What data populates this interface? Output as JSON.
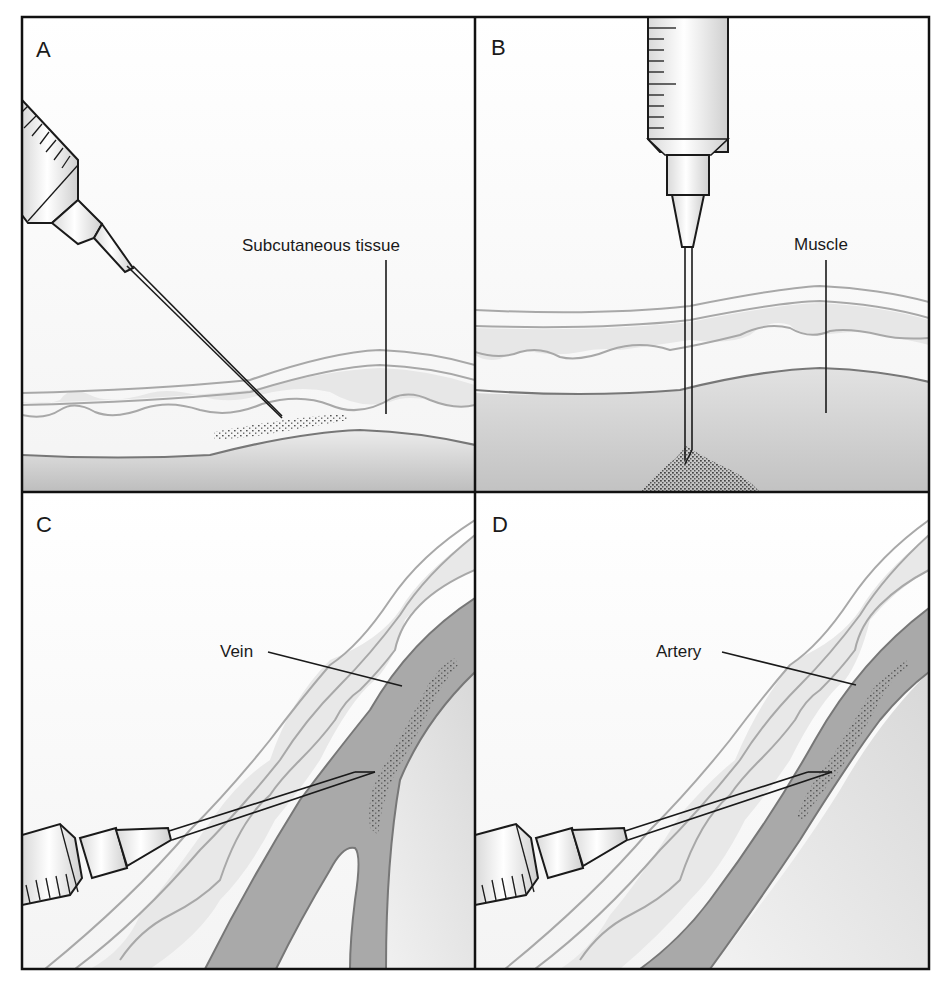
{
  "figure": {
    "panels": [
      {
        "id": "A",
        "letter": "A",
        "label": "Subcutaneous tissue",
        "injection_type": "subcutaneous"
      },
      {
        "id": "B",
        "letter": "B",
        "label": "Muscle",
        "injection_type": "intramuscular"
      },
      {
        "id": "C",
        "letter": "C",
        "label": "Vein",
        "injection_type": "intravenous"
      },
      {
        "id": "D",
        "letter": "D",
        "label": "Artery",
        "injection_type": "intra-arterial"
      }
    ],
    "colors": {
      "frame": "#111111",
      "skin_line": "#a8a8a8",
      "dermis_fill": "#e6e6e6",
      "deep_tissue": "#c8c8c8",
      "vessel": "#a9a9a9",
      "stipple": "#555555"
    }
  }
}
